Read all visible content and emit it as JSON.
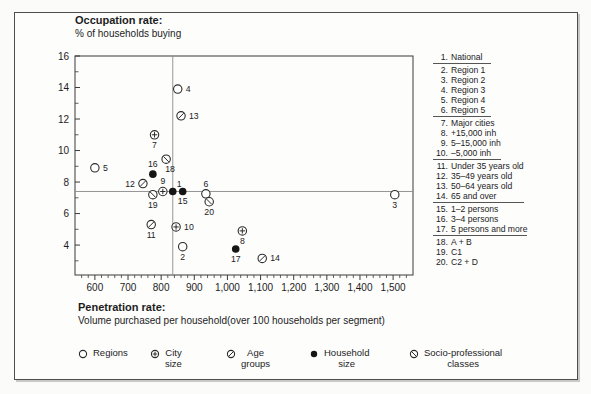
{
  "figure": {
    "y_axis_title": "Occupation rate:",
    "y_axis_subtitle": "% of households buying",
    "x_axis_title": "Penetration rate:",
    "x_axis_subtitle": "Volume purchased per household(over 100 households per segment)"
  },
  "chart_data": {
    "type": "scatter",
    "xlabel": "Penetration rate: Volume purchased per household(over 100 households per segment)",
    "ylabel": "Occupation rate: % of households buying",
    "x_axis": {
      "min": 540,
      "max": 1560,
      "tick_values": [
        600,
        700,
        800,
        900,
        1000,
        1100,
        1200,
        1300,
        1400,
        1500
      ],
      "tick_labels": [
        "600",
        "700",
        "800",
        "900",
        "1,000",
        "1,100",
        "1,200",
        "1,300",
        "1,400",
        "1,500"
      ],
      "minor_step": 20,
      "grid": false
    },
    "y_axis": {
      "min": 2.1,
      "max": 16,
      "tick_values": [
        4,
        6,
        8,
        10,
        12,
        14,
        16
      ],
      "tick_labels": [
        "4",
        "6",
        "8",
        "10",
        "12",
        "14",
        "16"
      ],
      "minor_values": [
        3,
        5,
        7,
        9,
        11,
        13,
        15
      ],
      "grid": false
    },
    "reference_lines": {
      "x": 835,
      "y": 7.4
    },
    "series": [
      {
        "name": "National",
        "marker": "filled-circle",
        "points": [
          {
            "label": "1",
            "name": "National",
            "x": 835,
            "y": 7.4,
            "label_pos": "above-right"
          }
        ]
      },
      {
        "name": "Regions",
        "marker": "open-circle",
        "points": [
          {
            "label": "2",
            "name": "Region 1",
            "x": 865,
            "y": 3.9,
            "label_pos": "below"
          },
          {
            "label": "3",
            "name": "Region 2",
            "x": 1505,
            "y": 7.2,
            "label_pos": "below"
          },
          {
            "label": "4",
            "name": "Region 3",
            "x": 850,
            "y": 13.9,
            "label_pos": "right"
          },
          {
            "label": "5",
            "name": "Region 4",
            "x": 600,
            "y": 8.9,
            "label_pos": "right"
          },
          {
            "label": "6",
            "name": "Region 5",
            "x": 935,
            "y": 7.25,
            "label_pos": "above"
          }
        ]
      },
      {
        "name": "City size",
        "marker": "circle-plus",
        "points": [
          {
            "label": "7",
            "name": "Major cities",
            "x": 780,
            "y": 11.0,
            "label_pos": "below"
          },
          {
            "label": "8",
            "name": "+15,000 inh",
            "x": 1045,
            "y": 4.9,
            "label_pos": "below"
          },
          {
            "label": "9",
            "name": "5–15,000 inh",
            "x": 805,
            "y": 7.4,
            "label_pos": "above"
          },
          {
            "label": "10",
            "name": "–5,000 inh",
            "x": 845,
            "y": 5.15,
            "label_pos": "right"
          }
        ]
      },
      {
        "name": "Age groups",
        "marker": "circle-slash",
        "points": [
          {
            "label": "11",
            "name": "Under 35 years old",
            "x": 770,
            "y": 5.3,
            "label_pos": "below"
          },
          {
            "label": "12",
            "name": "35–49 years old",
            "x": 745,
            "y": 7.9,
            "label_pos": "left"
          },
          {
            "label": "13",
            "name": "50–64 years old",
            "x": 860,
            "y": 12.2,
            "label_pos": "right"
          },
          {
            "label": "14",
            "name": "65 and over",
            "x": 1105,
            "y": 3.15,
            "label_pos": "right"
          }
        ]
      },
      {
        "name": "Household size",
        "marker": "filled-circle",
        "points": [
          {
            "label": "15",
            "name": "1–2 persons",
            "x": 865,
            "y": 7.4,
            "label_pos": "below"
          },
          {
            "label": "16",
            "name": "3–4 persons",
            "x": 775,
            "y": 8.5,
            "label_pos": "above"
          },
          {
            "label": "17",
            "name": "5 persons and more",
            "x": 1025,
            "y": 3.75,
            "label_pos": "below"
          }
        ]
      },
      {
        "name": "Socio-professional classes",
        "marker": "circle-backslash",
        "points": [
          {
            "label": "18",
            "name": "A + B",
            "x": 815,
            "y": 9.45,
            "label_pos": "below-right"
          },
          {
            "label": "19",
            "name": "C1",
            "x": 775,
            "y": 7.2,
            "label_pos": "below"
          },
          {
            "label": "20",
            "name": "C2 + D",
            "x": 945,
            "y": 6.75,
            "label_pos": "below"
          }
        ]
      }
    ]
  },
  "right_legend": {
    "groups": [
      {
        "items": [
          {
            "num": "1.",
            "text": "National"
          }
        ]
      },
      {
        "items": [
          {
            "num": "2.",
            "text": "Region 1"
          },
          {
            "num": "3.",
            "text": "Region 2"
          },
          {
            "num": "4.",
            "text": "Region 3"
          },
          {
            "num": "5.",
            "text": "Region 4"
          },
          {
            "num": "6.",
            "text": "Region 5"
          }
        ]
      },
      {
        "items": [
          {
            "num": "7.",
            "text": "Major cities"
          },
          {
            "num": "8.",
            "text": "+15,000 inh"
          },
          {
            "num": "9.",
            "text": "5–15,000 inh"
          },
          {
            "num": "10.",
            "text": "–5,000 inh"
          }
        ]
      },
      {
        "items": [
          {
            "num": "11.",
            "text": "Under 35 years old"
          },
          {
            "num": "12.",
            "text": "35–49 years old"
          },
          {
            "num": "13.",
            "text": "50–64 years old"
          },
          {
            "num": "14.",
            "text": "65 and over"
          }
        ]
      },
      {
        "items": [
          {
            "num": "15.",
            "text": "1–2 persons"
          },
          {
            "num": "16.",
            "text": "3–4 persons"
          },
          {
            "num": "17.",
            "text": "5 persons and more"
          }
        ]
      },
      {
        "items": [
          {
            "num": "18.",
            "text": "A + B"
          },
          {
            "num": "19.",
            "text": "C1"
          },
          {
            "num": "20.",
            "text": "C2 + D"
          }
        ]
      }
    ]
  },
  "bottom_legend": [
    {
      "marker": "open-circle",
      "label": "Regions",
      "lines": [
        "Regions"
      ]
    },
    {
      "marker": "circle-plus",
      "label": "City size",
      "lines": [
        "City",
        "size"
      ]
    },
    {
      "marker": "circle-slash",
      "label": "Age groups",
      "lines": [
        "Age",
        "groups"
      ]
    },
    {
      "marker": "filled-circle",
      "label": "Household size",
      "lines": [
        "Household",
        "size"
      ]
    },
    {
      "marker": "circle-backslash",
      "label": "Socio-professional classes",
      "lines": [
        "Socio-professional",
        "classes"
      ]
    }
  ]
}
